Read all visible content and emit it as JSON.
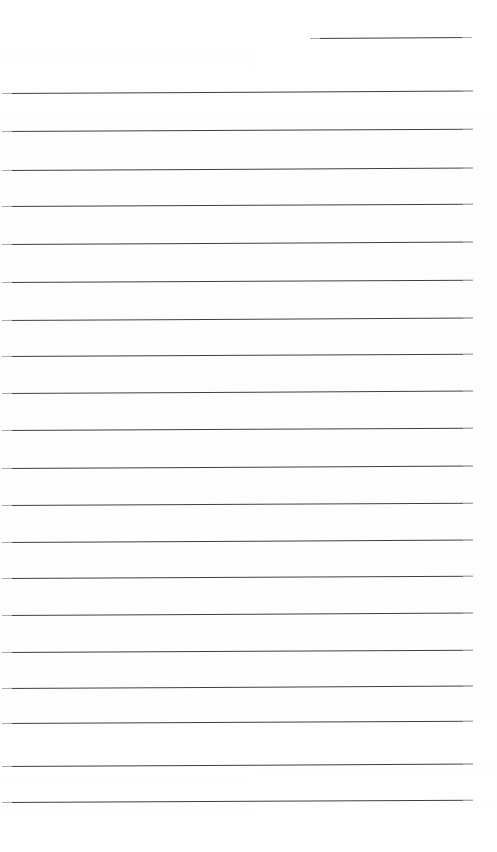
{
  "page": {
    "kind": "blank-lined-notepaper",
    "width_px": 497,
    "height_px": 852,
    "background_color": "#ffffff",
    "rule_color": "#2f3134",
    "rule_thickness_px": 1.4,
    "content_text": "",
    "note": "Blank scanned ruled page: no written text present"
  },
  "header": {
    "rule": {
      "x": 310,
      "y": 38,
      "width": 162,
      "skew_deg": -0.35
    }
  },
  "body": {
    "rule_count": 20,
    "rules": [
      {
        "x": 2,
        "y": 93,
        "width": 471,
        "skew_deg": -0.3
      },
      {
        "x": 2,
        "y": 131,
        "width": 471,
        "skew_deg": -0.28
      },
      {
        "x": 2,
        "y": 170,
        "width": 471,
        "skew_deg": -0.3
      },
      {
        "x": 2,
        "y": 206,
        "width": 471,
        "skew_deg": -0.26
      },
      {
        "x": 2,
        "y": 244,
        "width": 471,
        "skew_deg": -0.3
      },
      {
        "x": 2,
        "y": 282,
        "width": 471,
        "skew_deg": -0.28
      },
      {
        "x": 2,
        "y": 320,
        "width": 471,
        "skew_deg": -0.3
      },
      {
        "x": 2,
        "y": 356,
        "width": 471,
        "skew_deg": -0.26
      },
      {
        "x": 2,
        "y": 393,
        "width": 471,
        "skew_deg": -0.3
      },
      {
        "x": 2,
        "y": 430,
        "width": 471,
        "skew_deg": -0.28
      },
      {
        "x": 2,
        "y": 468,
        "width": 471,
        "skew_deg": -0.3
      },
      {
        "x": 2,
        "y": 505,
        "width": 471,
        "skew_deg": -0.28
      },
      {
        "x": 2,
        "y": 542,
        "width": 471,
        "skew_deg": -0.3
      },
      {
        "x": 2,
        "y": 578,
        "width": 471,
        "skew_deg": -0.26
      },
      {
        "x": 2,
        "y": 615,
        "width": 471,
        "skew_deg": -0.3
      },
      {
        "x": 2,
        "y": 652,
        "width": 471,
        "skew_deg": -0.28
      },
      {
        "x": 2,
        "y": 688,
        "width": 471,
        "skew_deg": -0.3
      },
      {
        "x": 2,
        "y": 723,
        "width": 471,
        "skew_deg": -0.26
      },
      {
        "x": 2,
        "y": 766,
        "width": 471,
        "skew_deg": -0.3
      },
      {
        "x": 2,
        "y": 802,
        "width": 471,
        "skew_deg": -0.28
      }
    ]
  }
}
